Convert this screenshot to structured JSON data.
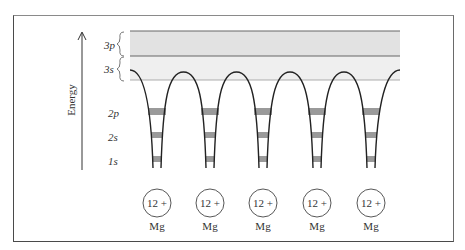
{
  "figure": {
    "axis_label": "Energy",
    "bands": [
      {
        "label": "3p",
        "name": "3p-band"
      },
      {
        "label": "3s",
        "name": "3s-band"
      }
    ],
    "levels": [
      {
        "label": "2p"
      },
      {
        "label": "2s"
      },
      {
        "label": "1s"
      }
    ],
    "ions": [
      {
        "charge": "12 +",
        "element": "Mg"
      },
      {
        "charge": "12 +",
        "element": "Mg"
      },
      {
        "charge": "12 +",
        "element": "Mg"
      },
      {
        "charge": "12 +",
        "element": "Mg"
      },
      {
        "charge": "12 +",
        "element": "Mg"
      }
    ],
    "colors": {
      "band_3p": "#e2e2e2",
      "band_3s": "#efefef",
      "level_fill": "#9a9a9a",
      "line": "#222222"
    }
  }
}
